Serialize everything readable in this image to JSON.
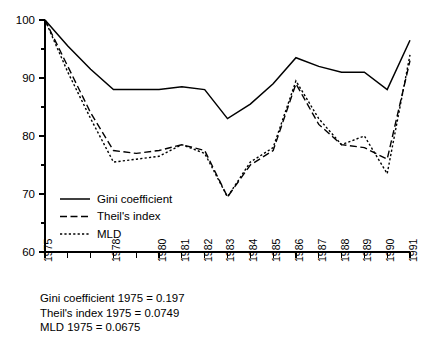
{
  "chart_data": {
    "type": "line",
    "title": "",
    "subtitle": "",
    "xlabel": "",
    "ylabel": "",
    "xlim": [
      1975,
      1991
    ],
    "ylim": [
      60,
      100
    ],
    "grid": false,
    "legend_position": "inside-lower-left",
    "y_ticks_major": [
      60,
      70,
      80,
      90,
      100
    ],
    "y_ticks_minor": [
      65,
      75,
      85,
      95
    ],
    "x": [
      1975,
      1976,
      1977,
      1978,
      1979,
      1980,
      1981,
      1982,
      1983,
      1984,
      1985,
      1986,
      1987,
      1988,
      1989,
      1990,
      1991
    ],
    "x_tick_labels": [
      "1975",
      "",
      "",
      "1978",
      "",
      "1980",
      "1981",
      "1982",
      "1983",
      "1984",
      "1985",
      "1986",
      "1987",
      "1988",
      "1989",
      "1990",
      "1991"
    ],
    "series": [
      {
        "name": "Gini coefficient",
        "style": "solid",
        "values": [
          100,
          95.5,
          91.5,
          88.0,
          88.0,
          88.0,
          88.5,
          88.0,
          83.0,
          85.5,
          89.0,
          93.5,
          92.0,
          91.0,
          91.0,
          88.0,
          96.5
        ]
      },
      {
        "name": "Theil's index",
        "style": "dashed",
        "values": [
          100,
          92.0,
          84.0,
          77.5,
          77.0,
          77.5,
          78.5,
          77.5,
          69.5,
          75.0,
          77.5,
          89.0,
          82.0,
          78.5,
          78.0,
          76.0,
          93.0
        ]
      },
      {
        "name": "MLD",
        "style": "dotted",
        "values": [
          100,
          91.0,
          83.0,
          75.5,
          76.0,
          76.5,
          78.5,
          77.0,
          69.5,
          75.5,
          78.0,
          89.5,
          83.0,
          78.5,
          80.0,
          73.5,
          94.0
        ]
      }
    ],
    "annotations": [
      "Gini coefficient 1975 = 0.197",
      "Theil's index 1975 = 0.0749",
      "MLD 1975 = 0.0675"
    ]
  },
  "legend": {
    "entries": [
      {
        "label": "Gini coefficient",
        "style": "solid"
      },
      {
        "label": "Theil's index",
        "style": "dashed"
      },
      {
        "label": "MLD",
        "style": "dotted"
      }
    ]
  },
  "y_axis": {
    "labels": [
      "100",
      "90",
      "80",
      "70",
      "60"
    ]
  },
  "x_axis": {
    "labels": [
      "1975",
      "1978",
      "1980",
      "1981",
      "1982",
      "1983",
      "1984",
      "1985",
      "1986",
      "1987",
      "1988",
      "1989",
      "1990",
      "1991"
    ]
  },
  "notes": {
    "line1": "Gini coefficient 1975 = 0.197",
    "line2": "Theil's index 1975 = 0.0749",
    "line3": "MLD 1975 = 0.0675"
  },
  "colors": {
    "ink": "#000000",
    "background": "#ffffff"
  }
}
